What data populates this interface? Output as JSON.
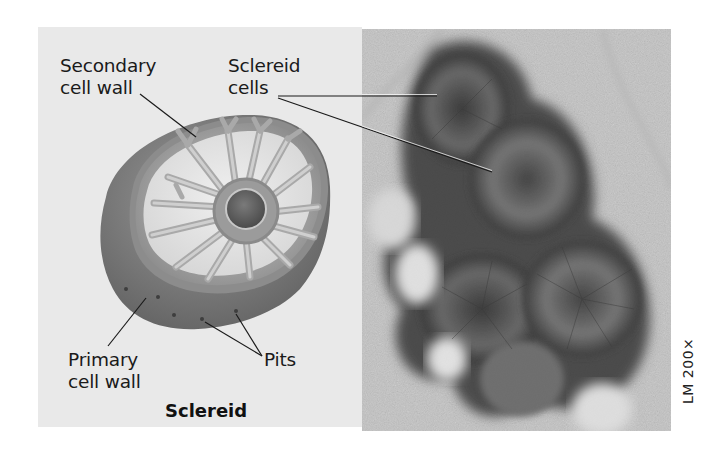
{
  "figure": {
    "diagram": {
      "title": "Sclereid",
      "labels": {
        "secondary_wall": {
          "line1": "Secondary",
          "line2": "cell wall"
        },
        "sclereid_cells": {
          "line1": "Sclereid",
          "line2": "cells"
        },
        "primary_wall": {
          "line1": "Primary",
          "line2": "cell wall"
        },
        "pits": "Pits"
      }
    },
    "micrograph": {
      "scale_label": "LM 200×"
    },
    "colors": {
      "panel_background": "#e9e9e9",
      "outer_wall": "#7a7a7a",
      "secondary_wall": "#dcdcdc",
      "canals": "#b5b5b5",
      "lumen": "#5e5e5e",
      "text": "#1a1a1a"
    }
  }
}
